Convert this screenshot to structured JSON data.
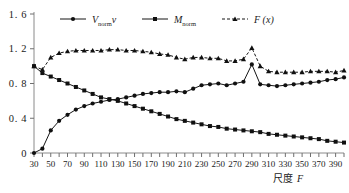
{
  "figure": {
    "background_color": "#ffffff",
    "axis_color": "#8a8a8a",
    "series_color": "#151515"
  },
  "legend": {
    "position": "top",
    "entries": [
      {
        "label_main": "V",
        "label_sub": "norm",
        "label_tail": "v",
        "style": "solid-circle",
        "name": "legend-v-norm"
      },
      {
        "label_main": "M",
        "label_sub": "norm",
        "label_tail": "",
        "style": "solid-square",
        "name": "legend-m-norm"
      },
      {
        "label_main": "F",
        "label_sub": "",
        "label_tail": " (x)",
        "style": "dashed-triangle",
        "name": "legend-f-x"
      }
    ]
  },
  "axes": {
    "x_title": "尺度 F",
    "x_title_cn": "尺度",
    "x_title_symbol": "F",
    "y_title": "",
    "y_ticks": [
      "0",
      "0. 4",
      "0. 8",
      "1. 2",
      "1. 6"
    ],
    "x_ticks": [
      "30",
      "50",
      "70",
      "90",
      "110",
      "130",
      "150",
      "170",
      "190",
      "210",
      "230",
      "250",
      "270",
      "290",
      "310",
      "330",
      "350",
      "370",
      "390"
    ]
  },
  "chart_data": {
    "type": "line",
    "title": "",
    "subtitle": "",
    "xlabel": "尺度 F",
    "ylabel": "",
    "xlim": [
      30,
      400
    ],
    "ylim": [
      0,
      1.6
    ],
    "grid": false,
    "legend_position": "top",
    "x": [
      30,
      40,
      50,
      60,
      70,
      80,
      90,
      100,
      110,
      120,
      130,
      140,
      150,
      160,
      170,
      180,
      190,
      200,
      210,
      220,
      230,
      240,
      250,
      260,
      270,
      280,
      290,
      300,
      310,
      320,
      330,
      340,
      350,
      360,
      370,
      380,
      390,
      400
    ],
    "series": [
      {
        "name": "V_normv",
        "marker": "circle",
        "linestyle": "solid",
        "values": [
          0.0,
          0.05,
          0.26,
          0.37,
          0.44,
          0.5,
          0.54,
          0.57,
          0.59,
          0.61,
          0.62,
          0.64,
          0.66,
          0.68,
          0.69,
          0.7,
          0.7,
          0.71,
          0.7,
          0.74,
          0.78,
          0.79,
          0.8,
          0.78,
          0.8,
          0.82,
          1.02,
          0.79,
          0.78,
          0.77,
          0.78,
          0.79,
          0.8,
          0.81,
          0.82,
          0.84,
          0.85,
          0.87
        ]
      },
      {
        "name": "M_norm",
        "marker": "square",
        "linestyle": "solid",
        "values": [
          1.0,
          0.92,
          0.88,
          0.84,
          0.8,
          0.76,
          0.72,
          0.68,
          0.64,
          0.62,
          0.6,
          0.57,
          0.54,
          0.51,
          0.48,
          0.45,
          0.42,
          0.39,
          0.37,
          0.35,
          0.33,
          0.31,
          0.3,
          0.28,
          0.27,
          0.26,
          0.25,
          0.24,
          0.22,
          0.21,
          0.2,
          0.19,
          0.18,
          0.17,
          0.16,
          0.14,
          0.13,
          0.12
        ]
      },
      {
        "name": "F (x)",
        "marker": "triangle",
        "linestyle": "dashed",
        "values": [
          1.0,
          0.96,
          1.1,
          1.15,
          1.17,
          1.18,
          1.18,
          1.18,
          1.18,
          1.19,
          1.19,
          1.18,
          1.18,
          1.17,
          1.16,
          1.14,
          1.13,
          1.1,
          1.08,
          1.1,
          1.1,
          1.09,
          1.09,
          1.06,
          1.06,
          1.08,
          1.21,
          1.0,
          0.94,
          0.93,
          0.93,
          0.93,
          0.93,
          0.94,
          0.94,
          0.94,
          0.93,
          0.95
        ]
      }
    ]
  }
}
